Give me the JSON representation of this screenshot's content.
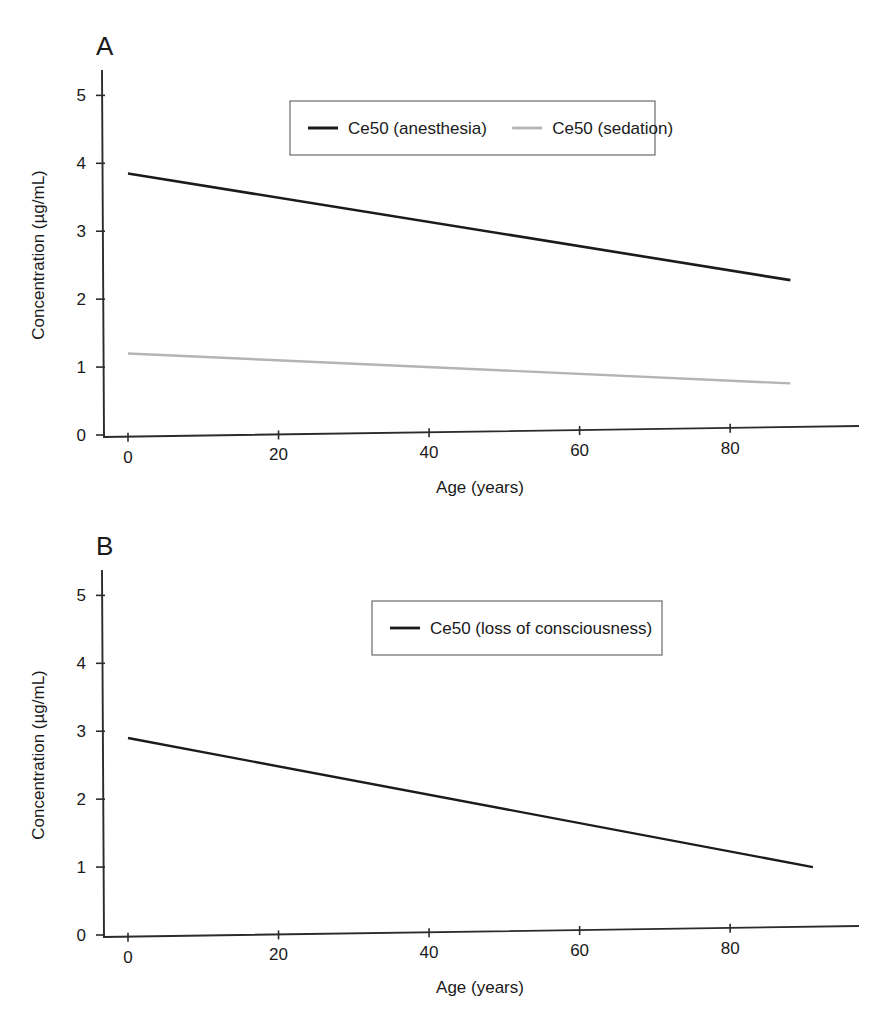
{
  "figure": {
    "panels": [
      {
        "letter": "A",
        "xlabel": "Age (years)",
        "ylabel": "Concentration (µg/mL)",
        "xticks": [
          "0",
          "20",
          "40",
          "60",
          "80"
        ],
        "yticks": [
          "0",
          "1",
          "2",
          "3",
          "4",
          "5"
        ],
        "legend": [
          {
            "label": "Ce50 (anesthesia)",
            "color": "#1b1b1b",
            "width": 2.6
          },
          {
            "label": "Ce50 (sedation)",
            "color": "#b4b4b4",
            "width": 2.4
          }
        ]
      },
      {
        "letter": "B",
        "xlabel": "Age (years)",
        "ylabel": "Concentration (µg/mL)",
        "xticks": [
          "0",
          "20",
          "40",
          "60",
          "80"
        ],
        "yticks": [
          "0",
          "1",
          "2",
          "3",
          "4",
          "5"
        ],
        "legend": [
          {
            "label": "Ce50 (loss of consciousness)",
            "color": "#1b1b1b",
            "width": 2.4
          }
        ]
      }
    ]
  },
  "chart_data": [
    {
      "type": "line",
      "panel": "A",
      "title": "",
      "xlabel": "Age (years)",
      "ylabel": "Concentration (µg/mL)",
      "xlim": [
        -4,
        93
      ],
      "ylim": [
        0,
        5.3
      ],
      "xticks": [
        0,
        20,
        40,
        60,
        80
      ],
      "yticks": [
        0,
        1,
        2,
        3,
        4,
        5
      ],
      "grid": false,
      "legend_position": "upper-center",
      "series": [
        {
          "name": "Ce50 (anesthesia)",
          "color": "#1b1b1b",
          "x": [
            0,
            88
          ],
          "values": [
            3.85,
            2.28
          ]
        },
        {
          "name": "Ce50 (sedation)",
          "color": "#b4b4b4",
          "x": [
            0,
            88
          ],
          "values": [
            1.2,
            0.76
          ]
        }
      ]
    },
    {
      "type": "line",
      "panel": "B",
      "title": "",
      "xlabel": "Age (years)",
      "ylabel": "Concentration (µg/mL)",
      "xlim": [
        -4,
        93
      ],
      "ylim": [
        0,
        5.3
      ],
      "xticks": [
        0,
        20,
        40,
        60,
        80
      ],
      "yticks": [
        0,
        1,
        2,
        3,
        4,
        5
      ],
      "grid": false,
      "legend_position": "upper-center",
      "series": [
        {
          "name": "Ce50 (loss of consciousness)",
          "color": "#1b1b1b",
          "x": [
            0,
            91
          ],
          "values": [
            2.9,
            1.0
          ]
        }
      ]
    }
  ]
}
